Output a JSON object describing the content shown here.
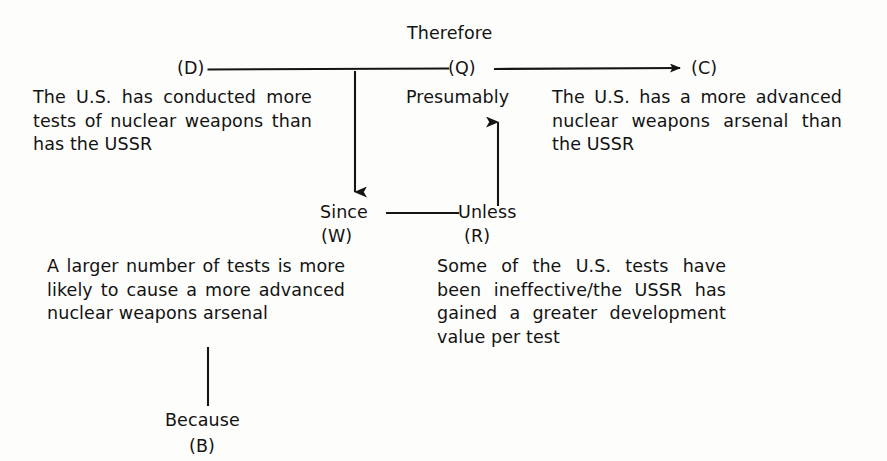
{
  "diagram": {
    "title_label": "Therefore",
    "nodes": {
      "d_label": "(D)",
      "q_label": "(Q)",
      "c_label": "(C)",
      "w_label": "(W)",
      "r_label": "(R)",
      "b_label": "(B)"
    },
    "connectors": {
      "presumably": "Presumably",
      "since": "Since",
      "unless": "Unless",
      "because": "Because"
    },
    "statements": {
      "data": "The U.S. has conducted more tests of nuclear weapons than has the USSR",
      "claim": "The U.S. has a more advanced nuclear weapons arsenal than the USSR",
      "warrant": "A larger number of tests is more likely to cause a more advanced nuclear weapons arsenal",
      "rebuttal": "Some of the U.S. tests have been ineffective/the USSR has gained a greater development value per test"
    },
    "colors": {
      "ink": "#131313",
      "line": "#151515",
      "page": "#fdfdfb"
    }
  }
}
